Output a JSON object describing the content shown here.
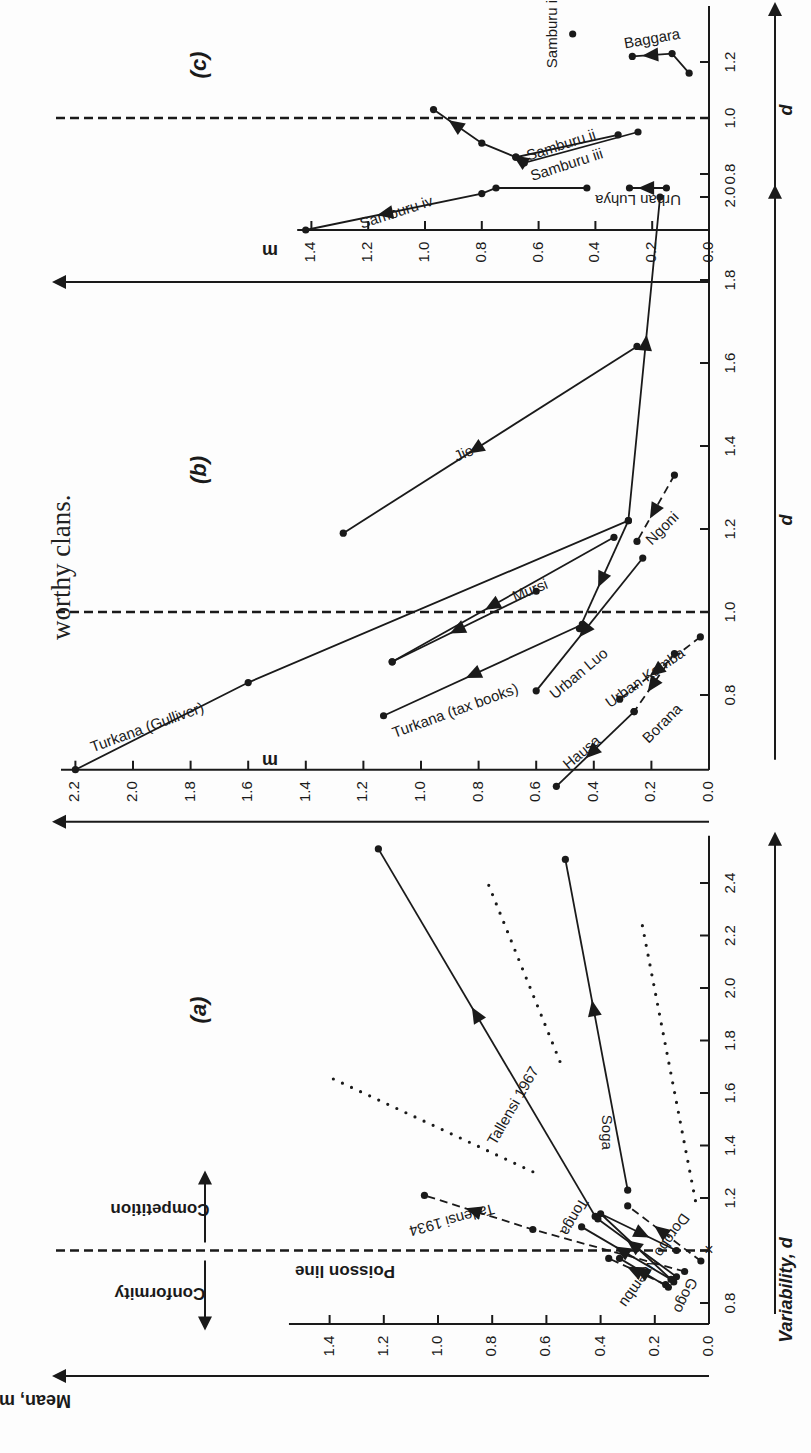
{
  "page": {
    "caption_fragment": "worthy clans.",
    "orientation": "figure rotated 90 degrees counter-clockwise on page"
  },
  "colors": {
    "ink": "#1a1a1a",
    "paper": "#fdfdfd"
  },
  "chart_data": [
    {
      "id": "a",
      "type": "line",
      "title": "(a)",
      "xlabel": "Variability, d",
      "ylabel": "Mean, m",
      "xlim": [
        0.7,
        2.6
      ],
      "ylim": [
        0.0,
        1.5
      ],
      "xticks": [
        0.8,
        1.0,
        1.2,
        1.4,
        1.6,
        1.8,
        2.0,
        2.2,
        2.4
      ],
      "xtick_labels": [
        "0.8",
        "",
        "1.2",
        "1.4",
        "1.6",
        "1.8",
        "2.0",
        "2.2",
        "2.4"
      ],
      "yticks": [
        0.0,
        0.2,
        0.4,
        0.6,
        0.8,
        1.0,
        1.2,
        1.4
      ],
      "ytick_labels": [
        "0.0",
        "0.2",
        "0.4",
        "0.6",
        "0.8",
        "1.0",
        "1.2",
        "1.4"
      ],
      "grid": false,
      "reference_line": {
        "d": 1.0,
        "label": "Poisson line",
        "style": "dashed"
      },
      "region_labels": [
        {
          "label": "Competition",
          "side": "d>1"
        },
        {
          "label": "Conformity",
          "side": "d<1"
        }
      ],
      "poisson_marker": {
        "d": 1.0,
        "m": 0.0,
        "symbol": "x"
      },
      "series": [
        {
          "name": "Tallensi 1967",
          "style": "solid",
          "points": [
            [
              1.13,
              0.42
            ],
            [
              2.53,
              1.22
            ]
          ],
          "label_pos": [
            1.55,
            0.72
          ],
          "label_angle": -60
        },
        {
          "name": "Tallensi 1934",
          "style": "dashed",
          "points": [
            [
              0.92,
              0.09
            ],
            [
              1.08,
              0.65
            ],
            [
              1.21,
              1.05
            ]
          ],
          "label_pos": [
            1.12,
            0.95
          ],
          "label_angle": 165
        },
        {
          "name": "Soga",
          "style": "solid",
          "points": [
            [
              1.23,
              0.3
            ],
            [
              2.49,
              0.53
            ]
          ],
          "label_pos": [
            1.45,
            0.38
          ],
          "label_angle": 90
        },
        {
          "name": "Tonga",
          "style": "solid",
          "points": [
            [
              0.88,
              0.13
            ],
            [
              1.14,
              0.4
            ],
            [
              1.0,
              0.12
            ]
          ],
          "label_pos": [
            1.13,
            0.5
          ],
          "label_angle": 120
        },
        {
          "name": "Dorobo",
          "style": "dashed",
          "points": [
            [
              0.96,
              0.03
            ],
            [
              1.17,
              0.3
            ]
          ],
          "label_pos": [
            1.06,
            0.14
          ],
          "label_angle": 125
        },
        {
          "name": "Gogo",
          "style": "solid",
          "points": [
            [
              0.89,
              0.14
            ],
            [
              1.09,
              0.47
            ]
          ],
          "label_pos": [
            0.83,
            0.09
          ],
          "label_angle": 115
        },
        {
          "name": "Gogo-2",
          "style": "solid",
          "points": [
            [
              0.9,
              0.12
            ],
            [
              1.12,
              0.41
            ]
          ],
          "label": ""
        },
        {
          "name": "Ndembu",
          "style": "dashed",
          "points": [
            [
              0.87,
              0.16
            ],
            [
              0.97,
              0.37
            ]
          ],
          "label_pos": [
            0.88,
            0.26
          ],
          "label_angle": 125
        },
        {
          "name": "Ndembu-2",
          "style": "solid",
          "points": [
            [
              0.86,
              0.15
            ],
            [
              0.97,
              0.33
            ]
          ],
          "label": ""
        }
      ],
      "guide_lines": [
        {
          "style": "dotted",
          "points": [
            [
              1.3,
              0.65
            ],
            [
              1.66,
              1.4
            ]
          ]
        },
        {
          "style": "dotted",
          "points": [
            [
              1.72,
              0.55
            ],
            [
              2.41,
              0.82
            ]
          ]
        },
        {
          "style": "dotted",
          "points": [
            [
              1.19,
              0.05
            ],
            [
              2.26,
              0.25
            ]
          ]
        }
      ]
    },
    {
      "id": "b",
      "type": "line",
      "title": "(b)",
      "xlabel": "d",
      "ylabel": "m",
      "xlim": [
        0.6,
        2.05
      ],
      "ylim": [
        0.0,
        2.25
      ],
      "xticks": [
        0.8,
        1.0,
        1.2,
        1.4,
        1.6,
        1.8,
        2.0
      ],
      "xtick_labels": [
        "0.8",
        "1.0",
        "1.2",
        "1.4",
        "1.6",
        "1.8",
        "2.0"
      ],
      "yticks": [
        0.0,
        0.2,
        0.4,
        0.6,
        0.8,
        1.0,
        1.2,
        1.4,
        1.6,
        1.8,
        2.0,
        2.2
      ],
      "ytick_labels": [
        "0.0",
        "0.2",
        "0.4",
        "0.6",
        "0.8",
        "1.0",
        "1.2",
        "1.4",
        "1.6",
        "1.8",
        "2.0",
        "2.2"
      ],
      "grid": false,
      "reference_line": {
        "d": 1.0,
        "label": "",
        "style": "dashed"
      },
      "series": [
        {
          "name": "Turkana (Gulliver)",
          "style": "solid",
          "points": [
            [
              0.62,
              2.2
            ],
            [
              0.83,
              1.6
            ],
            [
              1.22,
              0.28
            ],
            [
              2.0,
              0.17
            ]
          ],
          "label_pos": [
            0.72,
            1.95
          ],
          "label_angle": -20
        },
        {
          "name": "Jie",
          "style": "solid",
          "points": [
            [
              1.64,
              0.25
            ],
            [
              1.19,
              1.27
            ]
          ],
          "label_pos": [
            1.38,
            0.85
          ],
          "label_angle": -24
        },
        {
          "name": "Mursi",
          "style": "solid",
          "points": [
            [
              1.18,
              0.33
            ],
            [
              0.88,
              1.1
            ]
          ],
          "label_pos": [
            1.05,
            0.62
          ],
          "label_angle": -22
        },
        {
          "name": "Mursi-return",
          "style": "solid",
          "points": [
            [
              1.05,
              0.6
            ],
            [
              0.88,
              1.1
            ]
          ],
          "label": ""
        },
        {
          "name": "Turkana (tax books)",
          "style": "solid",
          "points": [
            [
              0.97,
              0.44
            ],
            [
              0.75,
              1.13
            ]
          ],
          "label_pos": [
            0.76,
            0.88
          ],
          "label_angle": -20
        },
        {
          "name": "Urban Luo",
          "style": "solid",
          "points": [
            [
              1.13,
              0.23
            ],
            [
              0.81,
              0.6
            ]
          ],
          "label_pos": [
            0.85,
            0.45
          ],
          "label_angle": -40
        },
        {
          "name": "Urban Luo-2",
          "style": "solid",
          "points": [
            [
              1.22,
              0.28
            ],
            [
              0.96,
              0.45
            ]
          ],
          "label": ""
        },
        {
          "name": "Ngoni",
          "style": "dashed",
          "points": [
            [
              1.33,
              0.12
            ],
            [
              1.17,
              0.25
            ]
          ],
          "label_pos": [
            1.2,
            0.16
          ],
          "label_angle": -45
        },
        {
          "name": "Urban Kamba",
          "style": "dashed",
          "points": [
            [
              0.94,
              0.03
            ],
            [
              0.79,
              0.31
            ]
          ],
          "label_pos": [
            0.84,
            0.22
          ],
          "label_angle": -35
        },
        {
          "name": "Borana",
          "style": "dashed",
          "points": [
            [
              0.9,
              0.12
            ],
            [
              0.76,
              0.26
            ]
          ],
          "label_pos": [
            0.73,
            0.16
          ],
          "label_angle": -45
        },
        {
          "name": "Hausa",
          "style": "solid",
          "points": [
            [
              0.76,
              0.26
            ],
            [
              0.58,
              0.53
            ]
          ],
          "label_pos": [
            0.66,
            0.44
          ],
          "label_angle": -40
        }
      ]
    },
    {
      "id": "c",
      "type": "line",
      "title": "(c)",
      "xlabel": "d",
      "ylabel": "m",
      "xlim": [
        0.6,
        1.4
      ],
      "ylim": [
        0.0,
        1.45
      ],
      "xticks": [
        0.8,
        1.0,
        1.2
      ],
      "xtick_labels": [
        "0.8",
        "1.0",
        "1.2"
      ],
      "yticks": [
        0.0,
        0.2,
        0.4,
        0.6,
        0.8,
        1.0,
        1.2,
        1.4
      ],
      "ytick_labels": [
        "0.0",
        "0.2",
        "0.4",
        "0.6",
        "0.8",
        "1.0",
        "1.2",
        "1.4"
      ],
      "grid": false,
      "reference_line": {
        "d": 1.0,
        "label": "",
        "style": "dashed"
      },
      "series": [
        {
          "name": "Samburu i",
          "style": "point",
          "points": [
            [
              1.3,
              0.48
            ]
          ],
          "label_pos": [
            1.3,
            0.55
          ],
          "label_angle": -90
        },
        {
          "name": "Samburu ii",
          "style": "solid",
          "points": [
            [
              0.94,
              0.32
            ],
            [
              0.86,
              0.68
            ],
            [
              0.91,
              0.8
            ],
            [
              1.03,
              0.97
            ]
          ],
          "label_pos": [
            0.9,
            0.52
          ],
          "label_angle": -18
        },
        {
          "name": "Samburu iii",
          "style": "solid",
          "points": [
            [
              0.95,
              0.25
            ],
            [
              0.84,
              0.65
            ],
            [
              0.86,
              0.68
            ]
          ],
          "label_pos": [
            0.83,
            0.5
          ],
          "label_angle": -18
        },
        {
          "name": "Samburu iv",
          "style": "solid",
          "points": [
            [
              0.75,
              0.43
            ],
            [
              0.75,
              0.75
            ],
            [
              0.73,
              0.8
            ],
            [
              0.6,
              1.42
            ]
          ],
          "label_pos": [
            0.66,
            1.1
          ],
          "label_angle": -18
        },
        {
          "name": "Urban Luhya",
          "style": "solid",
          "points": [
            [
              0.75,
              0.15
            ],
            [
              0.75,
              0.28
            ]
          ],
          "label_pos": [
            0.71,
            0.25
          ],
          "label_angle": 180
        },
        {
          "name": "Baggara",
          "style": "solid",
          "points": [
            [
              1.16,
              0.07
            ],
            [
              1.23,
              0.13
            ],
            [
              1.22,
              0.27
            ]
          ],
          "label_pos": [
            1.28,
            0.2
          ],
          "label_angle": -10
        }
      ]
    }
  ]
}
